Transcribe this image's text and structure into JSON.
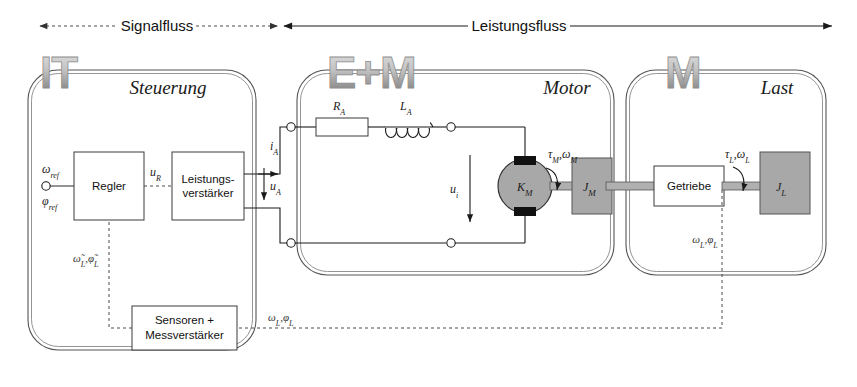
{
  "diagram": {
    "flows": [
      {
        "id": "signalfluss",
        "label": "Signalfluss",
        "style": "dashed",
        "arrows": "both"
      },
      {
        "id": "leistungsfluss",
        "label": "Leistungsfluss",
        "style": "solid",
        "arrows": "both"
      }
    ],
    "domains": [
      {
        "id": "steuerung",
        "logo": "IT",
        "label": "Steuerung"
      },
      {
        "id": "motor",
        "logo": "E+M",
        "label": "Motor"
      },
      {
        "id": "last",
        "logo": "M",
        "label": "Last"
      }
    ],
    "blocks": [
      {
        "id": "regler",
        "label": "Regler"
      },
      {
        "id": "leistungsverstaerker",
        "label_line1": "Leistungs-",
        "label_line2": "verstärker"
      },
      {
        "id": "sensoren",
        "label_line1": "Sensoren +",
        "label_line2": "Messverstärker"
      },
      {
        "id": "getriebe",
        "label": "Getriebe"
      }
    ],
    "components": [
      {
        "id": "armature-resistance",
        "symbol": "R",
        "sub": "A"
      },
      {
        "id": "armature-inductance",
        "symbol": "L",
        "sub": "A"
      },
      {
        "id": "motor-constant",
        "symbol": "K",
        "sub": "M"
      },
      {
        "id": "motor-inertia",
        "symbol": "J",
        "sub": "M"
      },
      {
        "id": "load-inertia",
        "symbol": "J",
        "sub": "L"
      }
    ],
    "signals": {
      "omega_ref": "ω",
      "omega_ref_sub": "ref",
      "phi_ref": "φ",
      "phi_ref_sub": "ref",
      "u_R": "u",
      "u_R_sub": "R",
      "i_A": "i",
      "i_A_sub": "A",
      "u_A": "u",
      "u_A_sub": "A",
      "u_i": "u",
      "u_i_sub": "i",
      "omega_L_hat": "ω̃",
      "omega_L_hat_sub": "L",
      "phi_L_hat": "φ̃",
      "phi_L_hat_sub": "L",
      "tau_M": "τ",
      "tau_M_sub": "M",
      "omega_M": "ω",
      "omega_M_sub": "M",
      "tau_L": "τ",
      "tau_L_sub": "L",
      "omega_L": "ω",
      "omega_L_sub": "L",
      "phi_L": "φ",
      "phi_L_sub": "L",
      "feedback_omega": "ω",
      "feedback_omega_sub": "L",
      "feedback_phi": "φ",
      "feedback_phi_sub": "L",
      "separator": ","
    },
    "colors": {
      "background": "#ffffff",
      "line": "#1a1a1a",
      "boundary": "#555555",
      "grey_fill": "#a8a8a8",
      "logo_light": "#d8d8d8",
      "logo_dark": "#6e6e6e",
      "dashed": "#4a4a4a"
    }
  }
}
